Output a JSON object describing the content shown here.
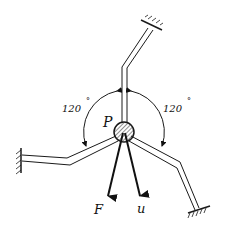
{
  "diagram": {
    "type": "mechanics-free-body",
    "labels": {
      "point": "P",
      "force": "F",
      "displacement": "u",
      "angle_left": "120",
      "angle_right": "120",
      "degree_symbol": "°"
    },
    "colors": {
      "line": "#1a1a1a",
      "background": "#ffffff"
    },
    "members": [
      {
        "name": "top-bar",
        "support": "fixed-wall"
      },
      {
        "name": "left-bar",
        "support": "fixed-wall"
      },
      {
        "name": "right-bar",
        "support": "fixed-wall"
      }
    ],
    "angles_between_members_deg": [
      120,
      120
    ]
  }
}
